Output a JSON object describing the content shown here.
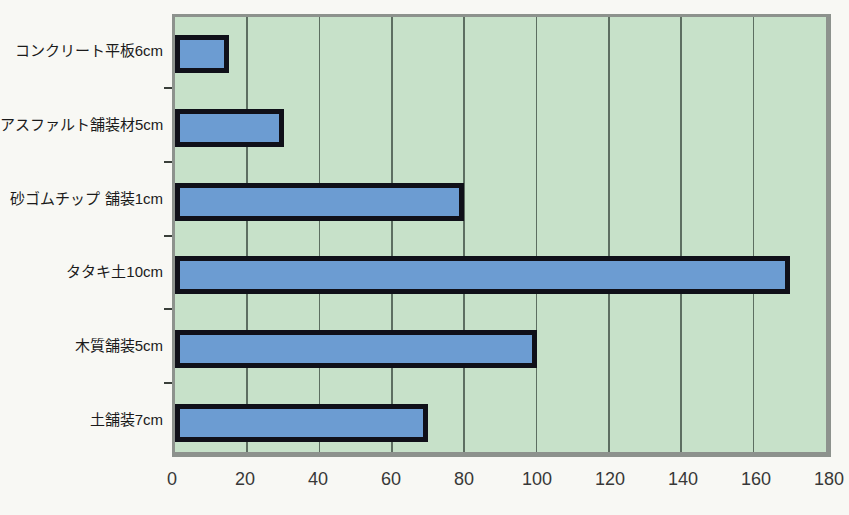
{
  "chart_data": {
    "type": "bar",
    "orientation": "horizontal",
    "title": "",
    "xlabel": "",
    "ylabel": "",
    "categories": [
      "コンクリート平板6cm",
      "アスファルト舗装材5cm",
      "砂ゴムチップ 舗装1cm",
      "タタキ土10cm",
      "木質舗装5cm",
      "土舗装7cm"
    ],
    "values": [
      15,
      30,
      80,
      170,
      100,
      70
    ],
    "xlim": [
      0,
      180
    ],
    "x_ticks": [
      "0",
      "20",
      "40",
      "60",
      "80",
      "100",
      "120",
      "140",
      "160",
      "180"
    ],
    "grid": true,
    "legend": false,
    "colors": {
      "plot_background": "#c7e1c9",
      "bar_fill": "#6c9cd2",
      "bar_border": "#101019",
      "gridline": "#5d6e61",
      "frame": "#8d928d",
      "page_background": "#f8f8f4",
      "tick_text": "#383838",
      "label_text": "#1b1b1b"
    }
  }
}
